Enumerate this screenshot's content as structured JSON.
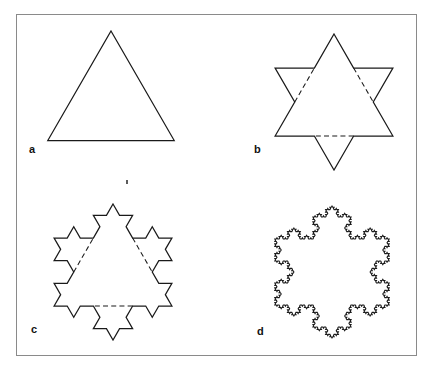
{
  "figure": {
    "background_color": "#ffffff",
    "frame_color": "#8a8a8a",
    "stroke_color": "#1a1a1a",
    "frame": {
      "x": 16,
      "y": 14,
      "width": 401,
      "height": 342
    },
    "panels": [
      {
        "id": "a",
        "label": "a",
        "stage": 0,
        "description": "equilateral triangle (initiator)",
        "segments": 3
      },
      {
        "id": "b",
        "label": "b",
        "stage": 1,
        "description": "six-pointed star; original triangle sides shown dashed",
        "segments": 12
      },
      {
        "id": "c",
        "label": "c",
        "stage": 2,
        "description": "second iteration; original triangle sides shown dashed",
        "segments": 48
      },
      {
        "id": "d",
        "label": "d",
        "stage": 4,
        "description": "higher iteration Koch snowflake curve",
        "segments": 768
      }
    ]
  },
  "chart_data": {
    "type": "line",
    "xlabel": "",
    "ylabel": "",
    "grid": false,
    "legend_position": "none",
    "series": [
      {
        "name": "a",
        "stage": 0,
        "shape": "equilateral-triangle",
        "center": [
          111,
          104
        ],
        "radius": 73,
        "rotation_deg": -90,
        "dashed_base_triangle": false
      },
      {
        "name": "b",
        "stage": 1,
        "shape": "koch-snowflake",
        "center": [
          334,
          102
        ],
        "radius": 68,
        "rotation_deg": -90,
        "dashed_base_triangle": true
      },
      {
        "name": "c",
        "stage": 2,
        "shape": "koch-snowflake",
        "center": [
          113,
          272
        ],
        "radius": 68,
        "rotation_deg": -90,
        "dashed_base_triangle": true
      },
      {
        "name": "d",
        "stage": 4,
        "shape": "koch-snowflake",
        "center": [
          332,
          272
        ],
        "radius": 66,
        "rotation_deg": -90,
        "dashed_base_triangle": false
      }
    ]
  }
}
